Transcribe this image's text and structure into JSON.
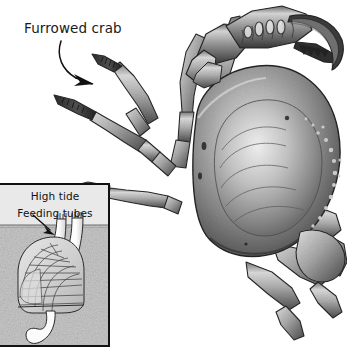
{
  "figure": {
    "title": "Furrowed crab",
    "background_color": "#ffffff",
    "width": 347,
    "height": 349
  },
  "callouts": [
    {
      "id": "furrowed-crab",
      "label": "Furrowed crab",
      "arrow": "curved-arrow-down-right",
      "points_to": "crab-walking-leg"
    }
  ],
  "main_illustration": {
    "subject": "Furrowed crab",
    "style": "grayscale scientific pen-and-ink stipple drawing",
    "parts": [
      "large-claw",
      "carapace",
      "walking-legs-left",
      "walking-legs-right",
      "small-claw"
    ],
    "colors": {
      "ink": "#2b2b2b",
      "mid_shade": "#8d8d8d",
      "light_shade": "#d6d6d6",
      "highlight": "#f2f2f2"
    }
  },
  "inset": {
    "id": "burrow-inset",
    "border_color": "#121212",
    "water_color": "#e9e9e9",
    "sediment_color": "#c9c9c9",
    "labels": {
      "high_tide": "High tide",
      "feeding_tubes": "Feeding tubes"
    },
    "arrow": "straight-arrow-down-right",
    "scene": {
      "description": "Buried bivalve in sediment with two feeding tubes (siphons) reaching up through the sediment surface into the water above at high tide",
      "elements": [
        "water-layer",
        "sediment-layer",
        "sediment-surface-line",
        "feeding-tube-left",
        "feeding-tube-right",
        "bivalve-shell",
        "bivalve-foot"
      ]
    }
  }
}
